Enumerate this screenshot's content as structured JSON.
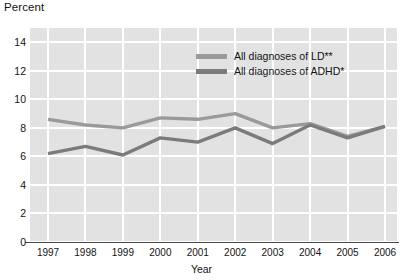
{
  "chart_data": {
    "type": "line",
    "title": "",
    "xlabel": "Year",
    "ylabel": "Percent",
    "categories": [
      "1997",
      "1998",
      "1999",
      "2000",
      "2001",
      "2002",
      "2003",
      "2004",
      "2005",
      "2006"
    ],
    "x": [
      1997,
      1998,
      1999,
      2000,
      2001,
      2002,
      2003,
      2004,
      2005,
      2006
    ],
    "xlim": [
      1997,
      2006
    ],
    "ylim": [
      0,
      15
    ],
    "yticks": [
      "0",
      "2",
      "4",
      "6",
      "8",
      "10",
      "12",
      "14"
    ],
    "ytick_values": [
      0,
      2,
      4,
      6,
      8,
      10,
      12,
      14
    ],
    "grid": "both",
    "legend_position": "upper-center-right",
    "series": [
      {
        "name": "All diagnoses of LD**",
        "color": "#9a9a9a",
        "values": [
          8.6,
          8.2,
          8.0,
          8.7,
          8.6,
          9.0,
          8.0,
          8.3,
          7.4,
          8.1
        ]
      },
      {
        "name": "All diagnoses of ADHD*",
        "color": "#7b7b7b",
        "values": [
          6.2,
          6.7,
          6.1,
          7.3,
          7.0,
          8.0,
          6.9,
          8.2,
          7.3,
          8.1
        ]
      }
    ]
  },
  "axes": {
    "y_title": "Percent",
    "x_title": "Year"
  },
  "legend": {
    "items": [
      {
        "label": "All diagnoses of LD**",
        "color": "#9a9a9a"
      },
      {
        "label": "All diagnoses of ADHD*",
        "color": "#7b7b7b"
      }
    ]
  },
  "colors": {
    "plot_background": "#e2e2e2",
    "gridline": "#ffffff",
    "axis_line": "#4a4a4a",
    "text": "#131313",
    "series_ld": "#9a9a9a",
    "series_adhd": "#7b7b7b"
  }
}
